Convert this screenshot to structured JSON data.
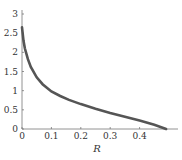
{
  "chart_data": {
    "type": "line",
    "title": "",
    "xlabel": "R",
    "ylabel": "",
    "xlim": [
      0,
      0.5
    ],
    "ylim": [
      0,
      3
    ],
    "x_ticks": [
      "0",
      "0.1",
      "0.2",
      "0.3",
      "0.4"
    ],
    "y_ticks": [
      "0",
      "0.5",
      "1",
      "1.5",
      "2",
      "2.5",
      "3"
    ],
    "grid": false,
    "legend": null,
    "series": [
      {
        "name": "curve",
        "color": "#555555",
        "x": [
          0.0,
          0.005,
          0.01,
          0.02,
          0.03,
          0.05,
          0.07,
          0.1,
          0.13,
          0.16,
          0.2,
          0.25,
          0.3,
          0.35,
          0.4,
          0.45,
          0.49
        ],
        "y": [
          2.65,
          2.3,
          2.1,
          1.82,
          1.62,
          1.35,
          1.17,
          0.98,
          0.86,
          0.76,
          0.65,
          0.53,
          0.42,
          0.32,
          0.22,
          0.11,
          0.0
        ]
      }
    ]
  }
}
